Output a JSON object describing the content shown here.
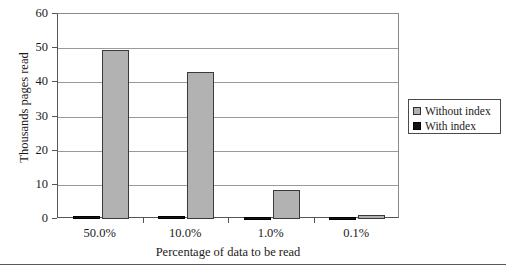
{
  "chart_data": {
    "type": "bar",
    "title": "",
    "xlabel": "Percentage of data to be read",
    "ylabel": "Thousands pages read",
    "categories": [
      "50.0%",
      "10.0%",
      "1.0%",
      "0.1%"
    ],
    "series": [
      {
        "name": "With index",
        "color": "#111111",
        "values": [
          1.0,
          0.9,
          0.7,
          0.6
        ]
      },
      {
        "name": "Without index",
        "color": "#b2b2b2",
        "values": [
          49.5,
          43.0,
          8.5,
          1.1
        ]
      }
    ],
    "ylim": [
      0,
      60
    ],
    "yticks": [
      0,
      10,
      20,
      30,
      40,
      50,
      60
    ],
    "grid": "horizontal",
    "legend_position": "right"
  },
  "legend": {
    "entries": [
      {
        "label": "Without index",
        "swatch": "gray-swatch"
      },
      {
        "label": "With index",
        "swatch": "black-swatch"
      }
    ]
  },
  "caption": {
    "text": ""
  }
}
